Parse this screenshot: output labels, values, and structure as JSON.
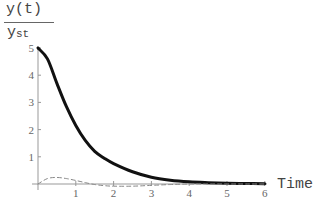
{
  "chart_data": {
    "type": "line",
    "title": "",
    "ylabel": {
      "numerator": "y(t)",
      "denominator_main": "y",
      "denominator_sub": "st"
    },
    "xlabel": "Time",
    "xlim": [
      0,
      6
    ],
    "ylim": [
      0,
      5
    ],
    "xticks": [
      "1",
      "2",
      "3",
      "4",
      "5",
      "6"
    ],
    "yticks": [
      "1",
      "2",
      "3",
      "4",
      "5"
    ],
    "grid": false,
    "legend": null,
    "series": [
      {
        "name": "solid",
        "style": "solid-thick",
        "color": "#111111",
        "x": [
          0,
          0.25,
          0.5,
          0.75,
          1,
          1.25,
          1.5,
          1.75,
          2,
          2.5,
          3,
          3.5,
          4,
          4.5,
          5,
          5.5,
          6
        ],
        "values": [
          5.0,
          4.6,
          3.7,
          2.85,
          2.15,
          1.6,
          1.2,
          0.95,
          0.75,
          0.45,
          0.25,
          0.14,
          0.08,
          0.05,
          0.03,
          0.02,
          0.01
        ]
      },
      {
        "name": "dashed",
        "style": "dashed-thin",
        "color": "#888888",
        "x": [
          0,
          0.25,
          0.5,
          0.75,
          1,
          1.25,
          1.5,
          1.75,
          2,
          2.5,
          3,
          3.5,
          4,
          4.5,
          5,
          5.5,
          6
        ],
        "values": [
          0,
          0.2,
          0.24,
          0.2,
          0.13,
          0.05,
          -0.02,
          -0.06,
          -0.08,
          -0.08,
          -0.05,
          -0.02,
          0,
          0,
          0,
          0,
          0
        ]
      }
    ]
  }
}
